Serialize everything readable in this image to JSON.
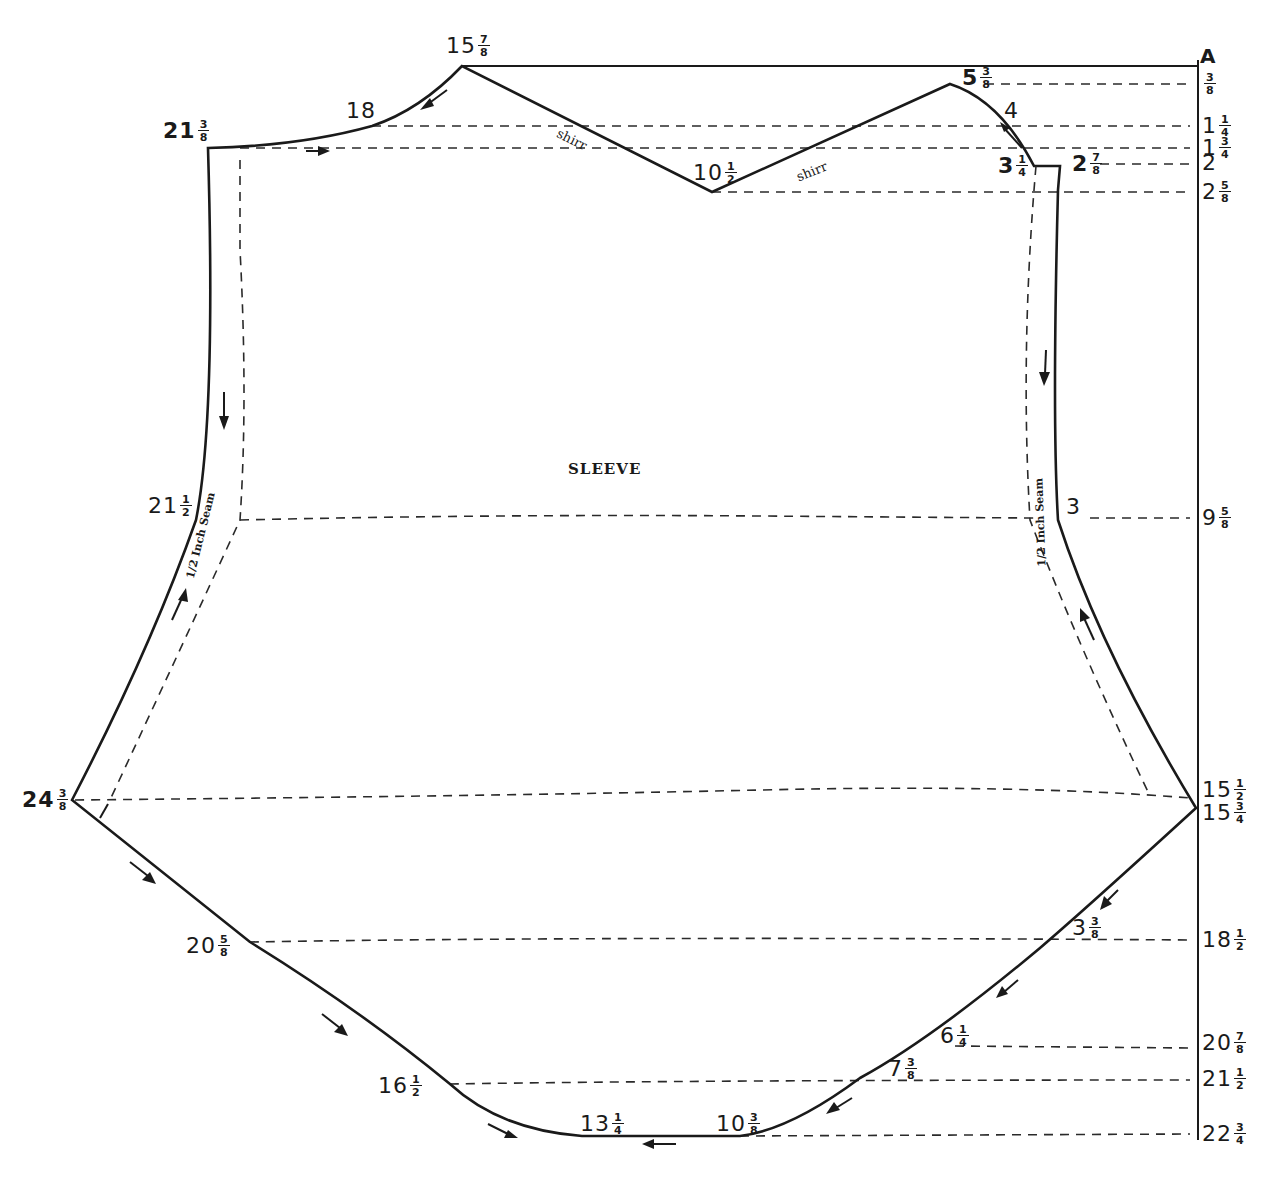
{
  "diagram": {
    "title": "SLEEVE",
    "point_label": "A",
    "seam_note": "1/2 Inch Seam",
    "shirr_note": "shirr",
    "colors": {
      "ink": "#1a1a1a",
      "paper": "#ffffff"
    }
  },
  "right_scale": [
    {
      "whole": "",
      "num": "3",
      "den": "8",
      "y": 84
    },
    {
      "whole": "1",
      "num": "1",
      "den": "4",
      "y": 126
    },
    {
      "whole": "1",
      "num": "3",
      "den": "4",
      "y": 148
    },
    {
      "whole": "2",
      "num": "",
      "den": "",
      "y": 164
    },
    {
      "whole": "2",
      "num": "5",
      "den": "8",
      "y": 192
    },
    {
      "whole": "9",
      "num": "5",
      "den": "8",
      "y": 518
    },
    {
      "whole": "15",
      "num": "1",
      "den": "2",
      "y": 790
    },
    {
      "whole": "15",
      "num": "3",
      "den": "4",
      "y": 813
    },
    {
      "whole": "18",
      "num": "1",
      "den": "2",
      "y": 940
    },
    {
      "whole": "20",
      "num": "7",
      "den": "8",
      "y": 1043
    },
    {
      "whole": "21",
      "num": "1",
      "den": "2",
      "y": 1079
    },
    {
      "whole": "22",
      "num": "3",
      "den": "4",
      "y": 1134
    }
  ],
  "point_labels": [
    {
      "id": "top-peak",
      "whole": "15",
      "num": "7",
      "den": "8",
      "x": 446,
      "y": 46,
      "bold": false
    },
    {
      "id": "cap-18",
      "whole": "18",
      "num": "",
      "den": "",
      "x": 346,
      "y": 112,
      "bold": false
    },
    {
      "id": "top-left-corner",
      "whole": "21",
      "num": "3",
      "den": "8",
      "x": 163,
      "y": 131,
      "bold": true
    },
    {
      "id": "center-v",
      "whole": "10",
      "num": "1",
      "den": "2",
      "x": 693,
      "y": 173,
      "bold": false
    },
    {
      "id": "right-peak",
      "whole": "5",
      "num": "3",
      "den": "8",
      "x": 962,
      "y": 78,
      "bold": true
    },
    {
      "id": "cap-4",
      "whole": "4",
      "num": "",
      "den": "",
      "x": 1004,
      "y": 112,
      "bold": false
    },
    {
      "id": "right-notch",
      "whole": "3",
      "num": "1",
      "den": "4",
      "x": 998,
      "y": 166,
      "bold": true
    },
    {
      "id": "right-corner",
      "whole": "2",
      "num": "7",
      "den": "8",
      "x": 1072,
      "y": 164,
      "bold": true
    },
    {
      "id": "left-mid",
      "whole": "21",
      "num": "1",
      "den": "2",
      "x": 148,
      "y": 506,
      "bold": false
    },
    {
      "id": "right-mid",
      "whole": "3",
      "num": "",
      "den": "",
      "x": 1066,
      "y": 508,
      "bold": false
    },
    {
      "id": "left-point",
      "whole": "24",
      "num": "3",
      "den": "8",
      "x": 22,
      "y": 800,
      "bold": true
    },
    {
      "id": "lower-left",
      "whole": "20",
      "num": "5",
      "den": "8",
      "x": 186,
      "y": 946,
      "bold": false
    },
    {
      "id": "lower-right",
      "whole": "3",
      "num": "3",
      "den": "8",
      "x": 1072,
      "y": 928,
      "bold": false
    },
    {
      "id": "bottom-r1",
      "whole": "6",
      "num": "1",
      "den": "4",
      "x": 940,
      "y": 1036,
      "bold": false
    },
    {
      "id": "bottom-r2",
      "whole": "7",
      "num": "3",
      "den": "8",
      "x": 888,
      "y": 1069,
      "bold": false
    },
    {
      "id": "bottom-left",
      "whole": "16",
      "num": "1",
      "den": "2",
      "x": 378,
      "y": 1086,
      "bold": false
    },
    {
      "id": "bottom-a",
      "whole": "13",
      "num": "1",
      "den": "4",
      "x": 580,
      "y": 1124,
      "bold": false
    },
    {
      "id": "bottom-b",
      "whole": "10",
      "num": "3",
      "den": "8",
      "x": 716,
      "y": 1124,
      "bold": false
    }
  ]
}
